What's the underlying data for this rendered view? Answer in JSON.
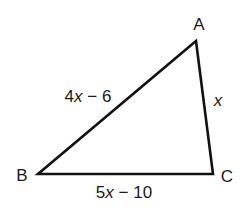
{
  "diagram": {
    "type": "triangle",
    "stroke_color": "#111111",
    "background": "#ffffff",
    "vertices": [
      {
        "name": "A",
        "x": 196,
        "y": 41,
        "label_x": 199,
        "label_y": 30
      },
      {
        "name": "B",
        "x": 38,
        "y": 174,
        "label_x": 22,
        "label_y": 181
      },
      {
        "name": "C",
        "x": 213,
        "y": 174,
        "label_x": 227,
        "label_y": 182
      }
    ],
    "sides": [
      {
        "id": "AB",
        "from": "A",
        "to": "B",
        "label": "4x − 6",
        "coef": "4",
        "var": "x",
        "rest": " − 6",
        "label_x": 88,
        "label_y": 102
      },
      {
        "id": "AC",
        "from": "A",
        "to": "C",
        "label": "x",
        "var": "x",
        "label_x": 218,
        "label_y": 106
      },
      {
        "id": "BC",
        "from": "B",
        "to": "C",
        "label": "5x − 10",
        "coef": "5",
        "var": "x",
        "rest": " − 10",
        "label_x": 124,
        "label_y": 198
      }
    ]
  }
}
